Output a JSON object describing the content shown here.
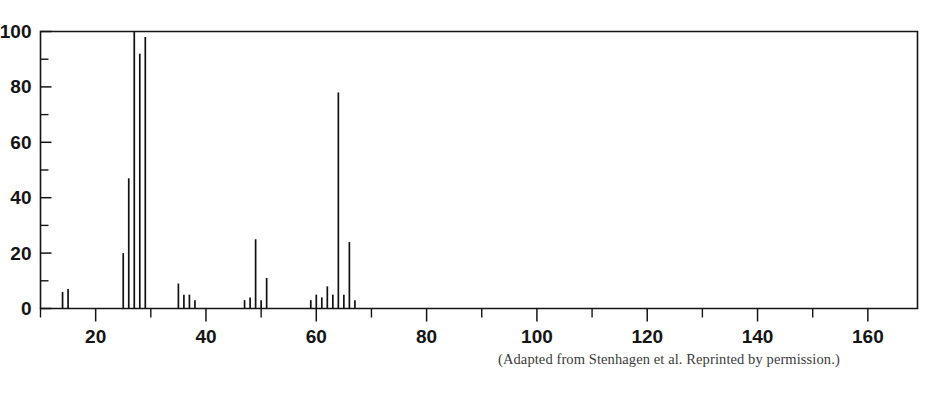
{
  "figure": {
    "caption": "(Adapted from Stenhagen et al. Reprinted by permission.)",
    "frame_color": "#141414",
    "peak_color": "#101010"
  },
  "chart_data": {
    "type": "bar",
    "title": "",
    "subtitle": "",
    "xlabel": "",
    "ylabel": "",
    "xlim": [
      10,
      169
    ],
    "ylim": [
      0,
      100
    ],
    "grid": false,
    "legend": "none",
    "x_major_ticks": [
      20,
      40,
      60,
      80,
      100,
      120,
      140,
      160
    ],
    "x_major_tick_labels": [
      "20",
      "40",
      "60",
      "80",
      "100",
      "120",
      "140",
      "160"
    ],
    "x_minor_tick_interval": 10,
    "y_major_ticks": [
      0,
      20,
      40,
      60,
      80,
      100
    ],
    "y_major_tick_labels": [
      "0",
      "20",
      "40",
      "60",
      "80",
      "100"
    ],
    "y_minor_ticks": [
      10,
      30,
      50,
      70,
      90
    ],
    "x": [
      14,
      15,
      25,
      26,
      27,
      28,
      29,
      35,
      36,
      37,
      38,
      47,
      48,
      49,
      50,
      51,
      59,
      60,
      61,
      62,
      63,
      64,
      65,
      66,
      67
    ],
    "values": [
      6,
      7,
      20,
      47,
      100,
      92,
      98,
      9,
      5,
      5,
      3,
      3,
      4,
      25,
      3,
      11,
      3,
      5,
      4,
      8,
      5,
      78,
      5,
      24,
      3
    ],
    "categories": [
      "14",
      "15",
      "25",
      "26",
      "27",
      "28",
      "29",
      "35",
      "36",
      "37",
      "38",
      "47",
      "48",
      "49",
      "50",
      "51",
      "59",
      "60",
      "61",
      "62",
      "63",
      "64",
      "65",
      "66",
      "67"
    ],
    "base_peak_mz": 27,
    "base_peak_value": 100
  }
}
